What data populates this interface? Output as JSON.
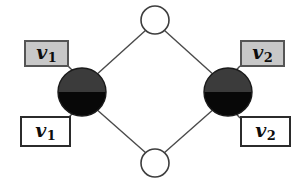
{
  "diagram": {
    "colors": {
      "edge": "#4a4a4a",
      "node_stroke": "#1a1a1a",
      "node_top_half": "#3b3b3b",
      "node_bottom_half": "#080808",
      "open_node_fill": "#ffffff",
      "shaded_box_fill": "#c8c8c8",
      "plain_box_fill": "#ffffff",
      "text": "#0d0d0d"
    },
    "nodes": [
      {
        "id": "top-open-node",
        "kind": "open-circle",
        "cx": 155,
        "cy": 20,
        "r": 14
      },
      {
        "id": "left-half-node",
        "kind": "half-filled-circle",
        "cx": 82,
        "cy": 92,
        "r": 24
      },
      {
        "id": "right-half-node",
        "kind": "half-filled-circle",
        "cx": 228,
        "cy": 92,
        "r": 24
      },
      {
        "id": "bottom-open-node",
        "kind": "open-circle",
        "cx": 155,
        "cy": 163,
        "r": 14
      }
    ],
    "edges": [
      {
        "from": "top-open-node",
        "to": "left-half-node"
      },
      {
        "from": "top-open-node",
        "to": "right-half-node"
      },
      {
        "from": "bottom-open-node",
        "to": "left-half-node"
      },
      {
        "from": "bottom-open-node",
        "to": "right-half-node"
      }
    ],
    "stubs": [
      {
        "node": "left-half-node",
        "to_box": "box-v1-shaded"
      },
      {
        "node": "left-half-node",
        "to_box": "box-v1-plain"
      },
      {
        "node": "right-half-node",
        "to_box": "box-v2-shaded"
      },
      {
        "node": "right-half-node",
        "to_box": "box-v2-plain"
      }
    ],
    "boxes": {
      "v1_shaded": {
        "base": "v",
        "sub": "1",
        "style": "shaded"
      },
      "v1_plain": {
        "base": "v",
        "sub": "1",
        "style": "plain"
      },
      "v2_shaded": {
        "base": "v",
        "sub": "2",
        "style": "shaded"
      },
      "v2_plain": {
        "base": "v",
        "sub": "2",
        "style": "plain"
      }
    }
  }
}
